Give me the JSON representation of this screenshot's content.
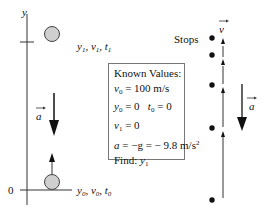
{
  "axis": {
    "y_label": "y",
    "zero_label": "0"
  },
  "top_ball_label": {
    "y": "y",
    "y_sub": "1",
    "v": "v",
    "v_sub": "1",
    "t": "t",
    "t_sub": "1"
  },
  "bottom_ball_label": {
    "y": "y",
    "y_sub": "0",
    "v": "v",
    "v_sub": "0",
    "t": "t",
    "t_sub": "0"
  },
  "accel_label": "a",
  "velocity_label": "v",
  "stops_label": "Stops",
  "known_values": {
    "title": "Known Values:",
    "line1": {
      "var": "v",
      "sub": "0",
      "rest": " = 100 m/s"
    },
    "line2": {
      "var": "y",
      "sub": "0",
      "rest": " = 0   ",
      "var2": "t",
      "sub2": "0",
      "rest2": " = 0"
    },
    "line3": {
      "var": "v",
      "sub": "1",
      "rest": " = 0"
    },
    "line4": {
      "var": "a",
      "rest": " = −g = − 9.8 m/s",
      "sup": "2"
    },
    "line5": {
      "text": "Find: ",
      "var": "y",
      "sub": "1"
    }
  },
  "colors": {
    "ball_fill": "#cfcfcf",
    "line": "#222222",
    "box_border": "#777777"
  }
}
